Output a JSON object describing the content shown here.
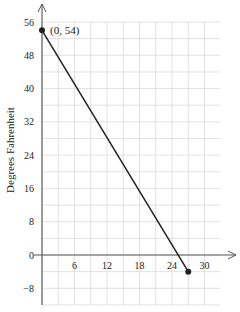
{
  "chart_data": {
    "type": "line",
    "title": "",
    "xlabel": "",
    "ylabel": "Degrees Fahrenheit",
    "xlim": [
      0,
      33
    ],
    "ylim": [
      -12,
      60
    ],
    "x_ticks": [
      6,
      12,
      18,
      24,
      30
    ],
    "y_ticks": [
      56,
      48,
      40,
      32,
      24,
      16,
      8,
      0,
      -8
    ],
    "grid": true,
    "series": [
      {
        "name": "temperature",
        "points": [
          {
            "x": 0,
            "y": 54
          },
          {
            "x": 27,
            "y": -4
          }
        ]
      }
    ],
    "annotations": [
      {
        "text": "(0, 54)",
        "x": 0,
        "y": 54
      }
    ],
    "colors": {
      "line": "#222222",
      "grid": "#d9d9d9",
      "axis": "#555555"
    }
  }
}
